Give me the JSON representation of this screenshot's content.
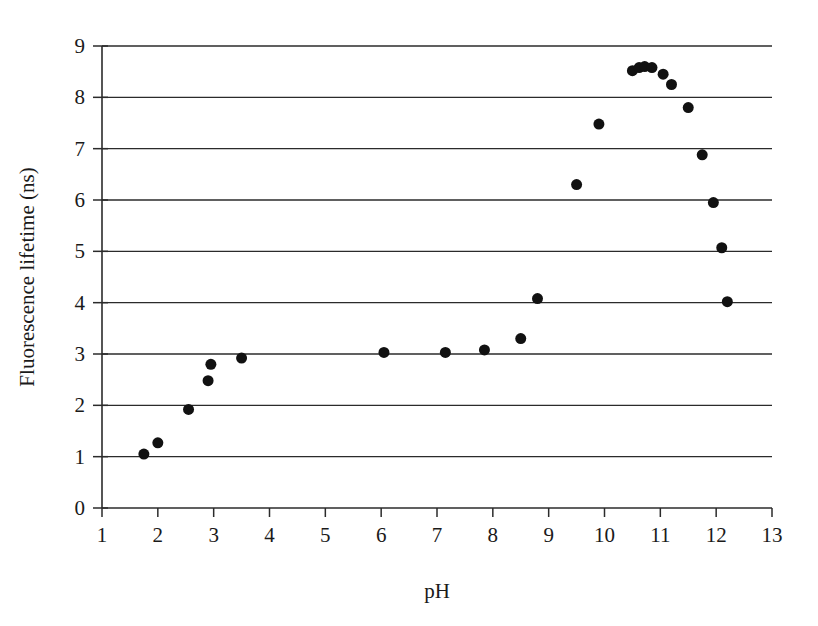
{
  "chart_data": {
    "type": "scatter",
    "title": "",
    "xlabel": "pH",
    "ylabel": "Fluorescence lifetime (ns)",
    "xlim": [
      1,
      13
    ],
    "ylim": [
      0,
      9
    ],
    "xticks": [
      1,
      2,
      3,
      4,
      5,
      6,
      7,
      8,
      9,
      10,
      11,
      12,
      13
    ],
    "xtick_labels": [
      "1",
      "2",
      "3",
      "4",
      "5",
      "6",
      "7",
      "8",
      "9",
      "10",
      "11",
      "12",
      "13"
    ],
    "yticks": [
      0,
      1,
      2,
      3,
      4,
      5,
      6,
      7,
      8,
      9
    ],
    "ytick_labels": [
      "0",
      "1",
      "2",
      "3",
      "4",
      "5",
      "6",
      "7",
      "8",
      "9"
    ],
    "grid": "horizontal",
    "gridlines_y": [
      1,
      2,
      3,
      4,
      5,
      6,
      7,
      8,
      9
    ],
    "legend": "none",
    "marker": "filled-circle",
    "marker_color": "#111111",
    "marker_size": 11,
    "series": [
      {
        "name": "Fluorescence lifetime",
        "x": [
          1.75,
          2.0,
          2.55,
          2.9,
          2.95,
          3.5,
          6.05,
          7.15,
          7.85,
          8.5,
          8.8,
          9.5,
          9.9,
          10.5,
          10.62,
          10.72,
          10.85,
          11.05,
          11.2,
          11.5,
          11.75,
          11.95,
          12.1,
          12.2
        ],
        "y": [
          1.05,
          1.27,
          1.92,
          2.48,
          2.8,
          2.92,
          3.03,
          3.03,
          3.08,
          3.3,
          4.08,
          6.3,
          7.48,
          8.52,
          8.58,
          8.6,
          8.58,
          8.45,
          8.25,
          7.8,
          6.88,
          5.95,
          5.07,
          4.02
        ]
      }
    ]
  },
  "axes": {
    "x_axis_name": "pH axis",
    "y_axis_name": "Fluorescence lifetime axis"
  }
}
